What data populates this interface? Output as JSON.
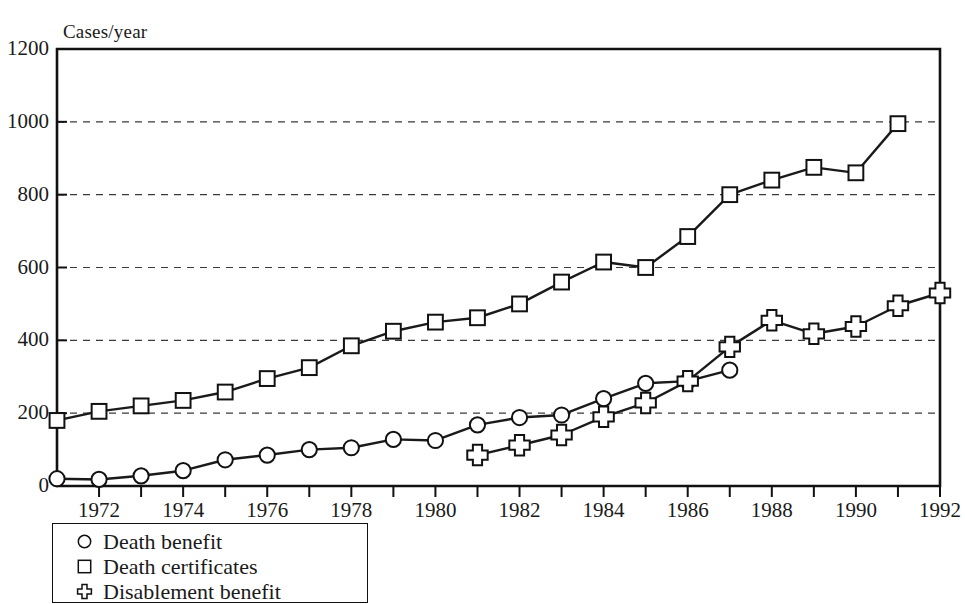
{
  "figure": {
    "y_axis_title": "Cases/year",
    "background_color": "#ffffff",
    "line_color": "#1a1a1a",
    "grid_color": "#3a3a3a"
  },
  "legend": {
    "items": [
      {
        "marker": "circle-marker",
        "label": "Death benefit"
      },
      {
        "marker": "square-marker",
        "label": "Death certificates"
      },
      {
        "marker": "cross-marker",
        "label": "Disablement benefit"
      }
    ]
  },
  "chart_data": {
    "type": "line",
    "title": "",
    "xlabel": "",
    "ylabel": "Cases/year",
    "xlim": [
      1971,
      1992
    ],
    "ylim": [
      0,
      1200
    ],
    "yticks": [
      0,
      200,
      400,
      600,
      800,
      1000,
      1200
    ],
    "ytick_labels": [
      "0",
      "200",
      "400",
      "600",
      "800",
      "1000",
      "1200"
    ],
    "xticks": [
      1971,
      1972,
      1973,
      1974,
      1975,
      1976,
      1977,
      1978,
      1979,
      1980,
      1981,
      1982,
      1983,
      1984,
      1985,
      1986,
      1987,
      1988,
      1989,
      1990,
      1991,
      1992
    ],
    "xtick_labels_shown": [
      "1972",
      "1974",
      "1976",
      "1978",
      "1980",
      "1982",
      "1984",
      "1986",
      "1988",
      "1990",
      "1992"
    ],
    "xtick_labels_years": [
      1972,
      1974,
      1976,
      1978,
      1980,
      1982,
      1984,
      1986,
      1988,
      1990,
      1992
    ],
    "grid": "horizontal-dashed",
    "legend_position": "below-axes-left",
    "series": [
      {
        "name": "Death certificates",
        "marker": "square",
        "x": [
          1971,
          1972,
          1973,
          1974,
          1975,
          1976,
          1977,
          1978,
          1979,
          1980,
          1981,
          1982,
          1983,
          1984,
          1985,
          1986,
          1987,
          1988,
          1989,
          1990,
          1991
        ],
        "values": [
          180,
          205,
          220,
          235,
          258,
          295,
          325,
          385,
          425,
          450,
          462,
          500,
          560,
          615,
          600,
          685,
          800,
          840,
          875,
          860,
          995
        ]
      },
      {
        "name": "Death benefit",
        "marker": "circle",
        "x": [
          1971,
          1972,
          1973,
          1974,
          1975,
          1976,
          1977,
          1978,
          1979,
          1980,
          1981,
          1982,
          1983,
          1984,
          1985,
          1986,
          1987
        ],
        "values": [
          20,
          18,
          28,
          42,
          72,
          85,
          100,
          105,
          128,
          125,
          168,
          188,
          195,
          240,
          282,
          288,
          318
        ]
      },
      {
        "name": "Disablement benefit",
        "marker": "cross",
        "x": [
          1981,
          1982,
          1983,
          1984,
          1985,
          1986,
          1987,
          1988,
          1989,
          1990,
          1991,
          1992
        ],
        "values": [
          85,
          112,
          140,
          190,
          228,
          288,
          382,
          455,
          418,
          438,
          495,
          530
        ]
      }
    ]
  }
}
